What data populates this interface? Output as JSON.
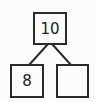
{
  "number_bond": {
    "whole": "10",
    "parts": [
      "8",
      ""
    ]
  }
}
